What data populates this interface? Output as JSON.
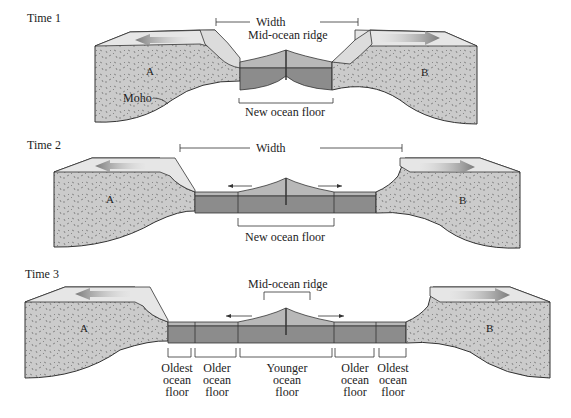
{
  "figure": {
    "panels": [
      {
        "time_label": "Time 1",
        "width_label": "Width",
        "ridge_label": "Mid-ocean ridge",
        "floor_label": "New ocean floor",
        "plate_left": "A",
        "plate_right": "B",
        "moho_label": "Moho"
      },
      {
        "time_label": "Time 2",
        "width_label": "Width",
        "floor_label": "New ocean floor",
        "plate_left": "A",
        "plate_right": "B"
      },
      {
        "time_label": "Time 3",
        "ridge_label": "Mid-ocean ridge",
        "plate_left": "A",
        "plate_right": "B",
        "floor_ages": [
          {
            "line1": "Oldest",
            "line2": "ocean",
            "line3": "floor"
          },
          {
            "line1": "Older",
            "line2": "ocean",
            "line3": "floor"
          },
          {
            "line1": "Younger",
            "line2": "ocean",
            "line3": "floor"
          },
          {
            "line1": "Older",
            "line2": "ocean",
            "line3": "floor"
          },
          {
            "line1": "Oldest",
            "line2": "ocean",
            "line3": "floor"
          }
        ]
      }
    ],
    "colors": {
      "continent_fill": "#c9c9c9",
      "continent_top": "#e6e6e6",
      "ocean_top": "#b8b8b8",
      "ocean_side": "#8c8c8c",
      "outline": "#333333",
      "arrow": "#888888"
    }
  }
}
